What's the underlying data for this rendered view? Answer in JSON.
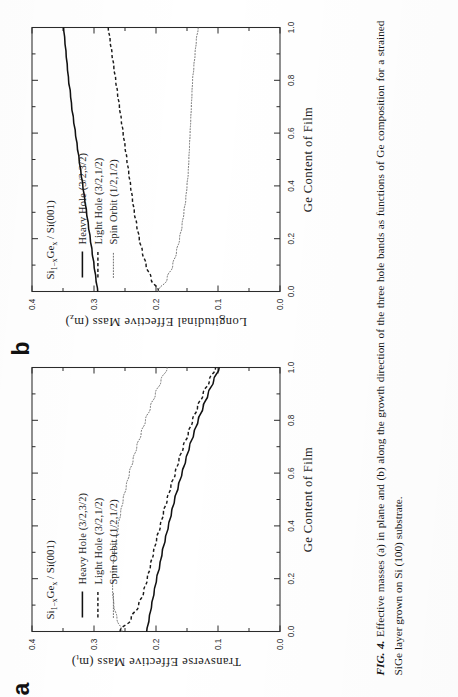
{
  "figure": {
    "caption_label": "FIG. 4.",
    "caption_text": "Effective masses (a) in plane and (b) along the growth direction of the three hole bands as functions of Ge composition for a strained SiGe layer grown on Si (100) substrate."
  },
  "panels": [
    {
      "letter": "a",
      "annotation_main": "Si",
      "annotation_sub1": "1−x",
      "annotation_mid": "Ge",
      "annotation_sub2": "x",
      "annotation_tail": " / Si(001)",
      "annotation_full": "Si1−xGex / Si(001)",
      "xlabel": "Ge Content of Film",
      "ylabel_main": "Transverse Effective Mass (m",
      "ylabel_sub": "t",
      "ylabel_tail": ")",
      "ylabel_full": "Transverse Effective Mass (m_t)",
      "xticks": [
        "0.0",
        "0.2",
        "0.4",
        "0.6",
        "0.8",
        "1.0"
      ],
      "yticks": [
        "0.0",
        "0.1",
        "0.2",
        "0.3",
        "0.4"
      ],
      "legend": [
        {
          "label": "Heavy Hole (3/2,3/2)",
          "style": "solid"
        },
        {
          "label": "Light Hole   (3/2,1/2)",
          "style": "dashed"
        },
        {
          "label": "Spin Orbit    (1/2,1/2)",
          "style": "dotted"
        }
      ]
    },
    {
      "letter": "b",
      "annotation_main": "Si",
      "annotation_sub1": "1−x",
      "annotation_mid": "Ge",
      "annotation_sub2": "x",
      "annotation_tail": " / Si(001)",
      "annotation_full": "Si1−xGex / Si(001)",
      "xlabel": "Ge Content of Film",
      "ylabel_main": "Longitudinal Effective Mass (m",
      "ylabel_sub": "z",
      "ylabel_tail": ")",
      "ylabel_full": "Longitudinal Effective Mass (m_z)",
      "xticks": [
        "0.0",
        "0.2",
        "0.4",
        "0.6",
        "0.8",
        "1.0"
      ],
      "yticks": [
        "0.0",
        "0.1",
        "0.2",
        "0.3",
        "0.4"
      ],
      "legend": [
        {
          "label": "Heavy Hole (3/2,3/2)",
          "style": "solid"
        },
        {
          "label": "Light Hole   (3/2,1/2)",
          "style": "dashed"
        },
        {
          "label": "Spin Orbit    (1/2,1/2)",
          "style": "dotted"
        }
      ]
    }
  ],
  "chart_data": [
    {
      "type": "line",
      "panel": "a",
      "title": "Si1-xGex / Si(001)",
      "xlabel": "Ge Content of Film",
      "ylabel": "Transverse Effective Mass (m_t)",
      "xlim": [
        0.0,
        1.0
      ],
      "ylim": [
        0.0,
        0.4
      ],
      "xticks": [
        0.0,
        0.2,
        0.4,
        0.6,
        0.8,
        1.0
      ],
      "yticks": [
        0.0,
        0.1,
        0.2,
        0.3,
        0.4
      ],
      "grid": false,
      "legend_position": "upper-left",
      "x": [
        0.0,
        0.05,
        0.1,
        0.15,
        0.2,
        0.25,
        0.3,
        0.35,
        0.4,
        0.45,
        0.5,
        0.55,
        0.6,
        0.65,
        0.7,
        0.75,
        0.8,
        0.85,
        0.9,
        0.95,
        1.0
      ],
      "series": [
        {
          "name": "Heavy Hole (3/2,3/2)",
          "style": "solid",
          "values": [
            0.215,
            0.211,
            0.207,
            0.203,
            0.199,
            0.194,
            0.19,
            0.185,
            0.18,
            0.175,
            0.17,
            0.164,
            0.158,
            0.152,
            0.146,
            0.139,
            0.132,
            0.124,
            0.116,
            0.107,
            0.098
          ]
        },
        {
          "name": "Light Hole (3/2,1/2)",
          "style": "dashed",
          "values": [
            0.258,
            0.24,
            0.228,
            0.22,
            0.214,
            0.209,
            0.204,
            0.199,
            0.193,
            0.188,
            0.182,
            0.176,
            0.169,
            0.163,
            0.156,
            0.148,
            0.141,
            0.133,
            0.124,
            0.114,
            0.104
          ]
        },
        {
          "name": "Spin Orbit (1/2,1/2)",
          "style": "dotted",
          "values": [
            0.255,
            0.263,
            0.268,
            0.27,
            0.27,
            0.269,
            0.267,
            0.264,
            0.261,
            0.257,
            0.253,
            0.248,
            0.243,
            0.237,
            0.231,
            0.224,
            0.217,
            0.209,
            0.201,
            0.192,
            0.182
          ]
        }
      ]
    },
    {
      "type": "line",
      "panel": "b",
      "title": "Si1-xGex / Si(001)",
      "xlabel": "Ge Content of Film",
      "ylabel": "Longitudinal Effective Mass (m_z)",
      "xlim": [
        0.0,
        1.0
      ],
      "ylim": [
        0.0,
        0.4
      ],
      "xticks": [
        0.0,
        0.2,
        0.4,
        0.6,
        0.8,
        1.0
      ],
      "yticks": [
        0.0,
        0.1,
        0.2,
        0.3,
        0.4
      ],
      "grid": false,
      "legend_position": "upper-left",
      "x": [
        0.0,
        0.05,
        0.1,
        0.15,
        0.2,
        0.25,
        0.3,
        0.35,
        0.4,
        0.45,
        0.5,
        0.55,
        0.6,
        0.65,
        0.7,
        0.75,
        0.8,
        0.85,
        0.9,
        0.95,
        1.0
      ],
      "series": [
        {
          "name": "Heavy Hole (3/2,3/2)",
          "style": "solid",
          "values": [
            0.294,
            0.297,
            0.3,
            0.303,
            0.306,
            0.309,
            0.312,
            0.315,
            0.318,
            0.321,
            0.324,
            0.327,
            0.33,
            0.333,
            0.336,
            0.338,
            0.341,
            0.343,
            0.345,
            0.347,
            0.349
          ]
        },
        {
          "name": "Light Hole (3/2,1/2)",
          "style": "dashed",
          "values": [
            0.196,
            0.208,
            0.216,
            0.222,
            0.227,
            0.231,
            0.235,
            0.238,
            0.241,
            0.244,
            0.247,
            0.25,
            0.253,
            0.256,
            0.259,
            0.262,
            0.265,
            0.268,
            0.271,
            0.274,
            0.277
          ]
        },
        {
          "name": "Spin Orbit (1/2,1/2)",
          "style": "dotted",
          "values": [
            0.196,
            0.182,
            0.173,
            0.167,
            0.162,
            0.158,
            0.155,
            0.152,
            0.15,
            0.148,
            0.147,
            0.146,
            0.145,
            0.144,
            0.143,
            0.142,
            0.141,
            0.139,
            0.137,
            0.135,
            0.132
          ]
        }
      ]
    }
  ]
}
